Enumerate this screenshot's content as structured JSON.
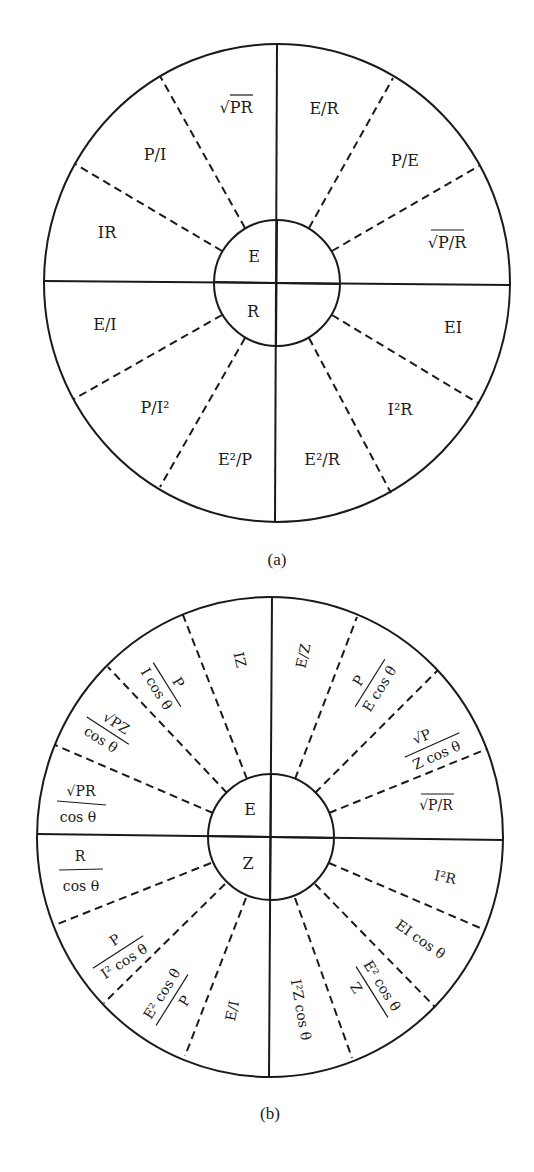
{
  "wheel_a": {
    "caption": "(a)",
    "center": {
      "top": "E",
      "bottom": "R"
    },
    "upper_left": [
      "IR",
      "P/I",
      "√PR"
    ],
    "upper_right": [
      "E/R",
      "P/E",
      "√P/R"
    ],
    "lower_right": [
      "EI",
      "I²R",
      "E²/R"
    ],
    "lower_left": [
      "E²/P",
      "P/I²",
      "E/I"
    ]
  },
  "wheel_b": {
    "caption": "(b)",
    "center": {
      "top": "E",
      "bottom": "Z"
    },
    "upper_left": [
      {
        "num": "√PR",
        "den": "cos θ"
      },
      {
        "num": "√PZ",
        "den": "cos θ"
      },
      {
        "num": "P",
        "den": "I cos θ"
      },
      {
        "text": "IZ"
      }
    ],
    "upper_right": [
      {
        "text": "E/Z"
      },
      {
        "num": "P",
        "den": "E cos θ"
      },
      {
        "num": "√P",
        "den": "Z cos θ"
      },
      {
        "text": "√P/R"
      }
    ],
    "lower_right": [
      {
        "text": "I²R"
      },
      {
        "text": "EI cos θ"
      },
      {
        "num": "E² cos θ",
        "den": "Z"
      },
      {
        "text": "I²Z cos θ"
      }
    ],
    "lower_left": [
      {
        "text": "E/I"
      },
      {
        "num": "E² cos θ",
        "den": "P"
      },
      {
        "num": "P",
        "den": "I² cos θ"
      },
      {
        "num": "R",
        "den": "cos θ"
      }
    ]
  }
}
